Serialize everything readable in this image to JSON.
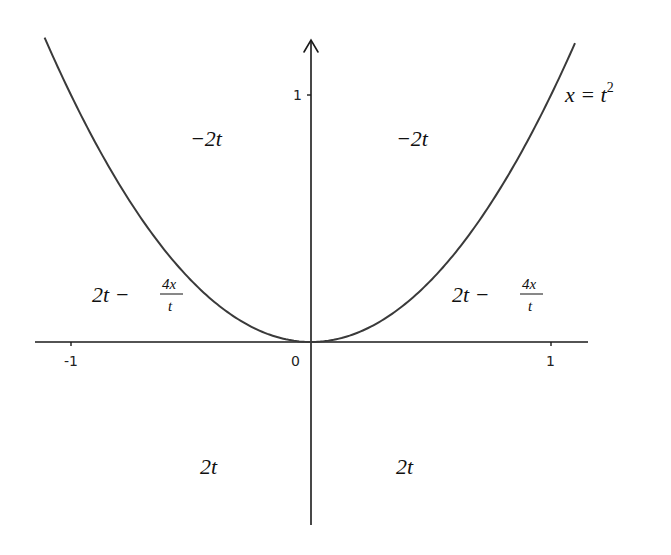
{
  "chart_data": {
    "type": "line",
    "title": "",
    "xlabel": "t",
    "ylabel": "x",
    "xlim": [
      -1.15,
      1.15
    ],
    "ylim": [
      -0.75,
      1.25
    ],
    "grid": false,
    "x_ticks": [
      {
        "value": -1,
        "label": "-1"
      },
      {
        "value": 0,
        "label": "0"
      },
      {
        "value": 1,
        "label": "1"
      }
    ],
    "y_ticks": [
      {
        "value": 1,
        "label": "1"
      }
    ],
    "series": [
      {
        "name": "x = t^2",
        "equation": "x = t^2",
        "t_range": [
          -1.11,
          1.1
        ]
      }
    ],
    "annotations": [
      {
        "id": "curve-label",
        "text_base": "x = t",
        "superscript": "2",
        "t": 1.08,
        "x": 1.0
      },
      {
        "id": "upper-left",
        "text": "−2t",
        "t": -0.42,
        "x": 0.8
      },
      {
        "id": "upper-right",
        "text": "−2t",
        "t": 0.42,
        "x": 0.8
      },
      {
        "id": "mid-left",
        "text_prefix": "2t − ",
        "frac_num": "4x",
        "frac_den": "t",
        "t": -0.9,
        "x": 0.23
      },
      {
        "id": "mid-right",
        "text_prefix": "2t − ",
        "frac_num": "4x",
        "frac_den": "t",
        "t": 0.6,
        "x": 0.23
      },
      {
        "id": "lower-left",
        "text": "2t",
        "t": -0.42,
        "x": -0.52
      },
      {
        "id": "lower-right",
        "text": "2t",
        "t": 0.42,
        "x": -0.52
      }
    ]
  },
  "axes": {
    "origin_label": "0",
    "x_neg1_label": "-1",
    "x_pos1_label": "1",
    "y_pos1_label": "1"
  },
  "labels": {
    "curve_base": "x = t",
    "curve_sup": "2",
    "upper_left": "−2t",
    "upper_right": "−2t",
    "mid_prefix": "2t −",
    "frac_num": "4x",
    "frac_den": "t",
    "lower_left": "2t",
    "lower_right": "2t"
  },
  "colors": {
    "axis": "#1a1a1a",
    "curve": "#3a3a3a",
    "text": "#111111",
    "background": "#ffffff"
  }
}
